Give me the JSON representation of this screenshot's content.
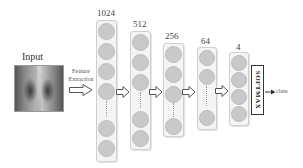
{
  "input": {
    "label": "Input",
    "image": "chest-xray"
  },
  "feature_extraction": {
    "line1": "Feature",
    "line2": "Extraction"
  },
  "layers": [
    {
      "units": "1024"
    },
    {
      "units": "512"
    },
    {
      "units": "256"
    },
    {
      "units": "64"
    },
    {
      "units": "4"
    }
  ],
  "softmax": {
    "label": "SOFTMAX"
  },
  "output": {
    "label": "class"
  },
  "colors": {
    "node": "#c9c9c9",
    "column_bg": "#f4f4f4",
    "column_border": "#cfcfcf",
    "line": "#333333"
  }
}
